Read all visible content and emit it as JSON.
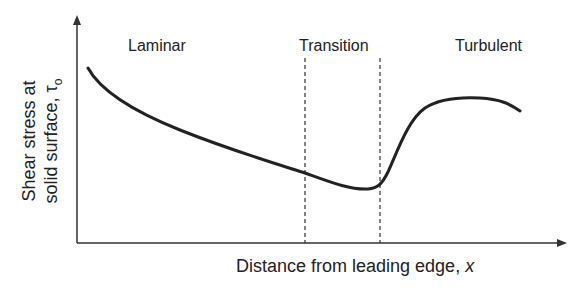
{
  "diagram": {
    "regions": [
      {
        "label": "Laminar"
      },
      {
        "label": "Transition"
      },
      {
        "label": "Turbulent"
      }
    ],
    "y_axis": {
      "line1": "Shear stress at",
      "line2": "solid surface, τ",
      "subscript": "o"
    },
    "x_axis": {
      "label": "Distance from leading edge, ",
      "var": "x"
    },
    "colors": {
      "line": "#222222",
      "background": "#ffffff"
    }
  }
}
